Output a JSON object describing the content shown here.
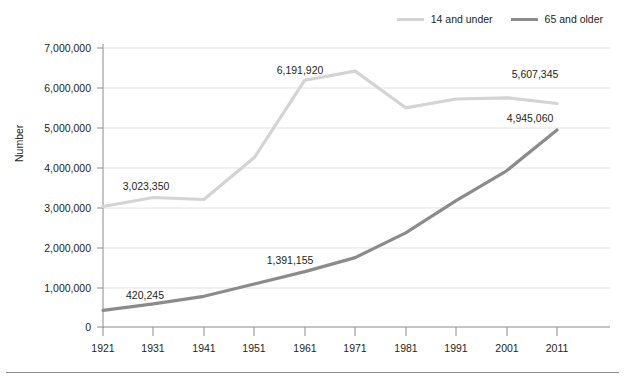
{
  "chart_data": {
    "type": "line",
    "title": "",
    "xlabel": "",
    "ylabel": "Number",
    "x": [
      1921,
      1931,
      1941,
      1951,
      1961,
      1971,
      1981,
      1991,
      2001,
      2011
    ],
    "categories": [
      "1921",
      "1931",
      "1941",
      "1951",
      "1961",
      "1971",
      "1981",
      "1991",
      "2001",
      "2011"
    ],
    "ylim": [
      0,
      7000000
    ],
    "xlim": [
      1921,
      2011
    ],
    "grid": true,
    "legend_position": "top-right",
    "ytick_labels": [
      "7,000,000",
      "6,000,000",
      "5,000,000",
      "4,000,000",
      "3,000,000",
      "2,000,000",
      "1,000,000",
      "0"
    ],
    "ytick_values": [
      7000000,
      6000000,
      5000000,
      4000000,
      3000000,
      2000000,
      1000000,
      0
    ],
    "series": [
      {
        "name": "14 and under",
        "color": "#d4d4d4",
        "values": [
          3023350,
          3250000,
          3200000,
          4250000,
          6191920,
          6420000,
          5500000,
          5720000,
          5750000,
          5607345
        ]
      },
      {
        "name": "65 and older",
        "color": "#8b8b8b",
        "values": [
          420245,
          580000,
          770000,
          1080000,
          1391155,
          1740000,
          2360000,
          3170000,
          3920000,
          4945060
        ]
      }
    ],
    "annotations": [
      {
        "series": "14 and under",
        "x": 1921,
        "value": 3023350,
        "label": "3,023,350"
      },
      {
        "series": "14 and under",
        "x": 1961,
        "value": 6191920,
        "label": "6,191,920"
      },
      {
        "series": "14 and under",
        "x": 2011,
        "value": 5607345,
        "label": "5,607,345"
      },
      {
        "series": "65 and older",
        "x": 1921,
        "value": 420245,
        "label": "420,245"
      },
      {
        "series": "65 and older",
        "x": 1961,
        "value": 1391155,
        "label": "1,391,155"
      },
      {
        "series": "65 and older",
        "x": 2011,
        "value": 4945060,
        "label": "4,945,060"
      }
    ]
  },
  "legend": {
    "items": [
      {
        "label": "14 and under",
        "color": "#d4d4d4"
      },
      {
        "label": "65 and older",
        "color": "#8b8b8b"
      }
    ]
  },
  "axes": {
    "y_title": "Number"
  }
}
